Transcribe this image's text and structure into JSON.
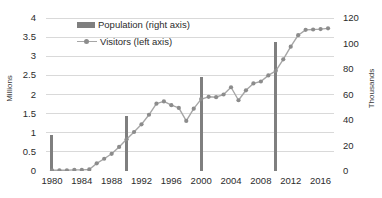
{
  "chart_data": {
    "type": "line",
    "title": "",
    "xlabel": "",
    "ylabel": "Millions",
    "ylabel_right": "Thousands",
    "grid": true,
    "legend_position": "top-left-inside",
    "x": [
      1980,
      1981,
      1982,
      1983,
      1984,
      1985,
      1986,
      1987,
      1988,
      1989,
      1990,
      1991,
      1992,
      1993,
      1994,
      1995,
      1996,
      1997,
      1998,
      1999,
      2000,
      2001,
      2002,
      2003,
      2004,
      2005,
      2006,
      2007,
      2008,
      2009,
      2010,
      2011,
      2012,
      2013,
      2014,
      2015,
      2016,
      2017
    ],
    "xticks": [
      1980,
      1984,
      1988,
      1992,
      1996,
      2000,
      2004,
      2008,
      2012,
      2016
    ],
    "xlim": [
      1979.2,
      2017.8
    ],
    "ylim_left": [
      0,
      4
    ],
    "yticks_left": [
      0,
      0.5,
      1,
      1.5,
      2,
      2.5,
      3,
      3.5,
      4
    ],
    "ylim_right": [
      0,
      120
    ],
    "yticks_right": [
      0,
      20,
      40,
      60,
      80,
      100,
      120
    ],
    "series": [
      {
        "name": "Visitors (left axis)",
        "axis": "left",
        "render": "line-markers",
        "color": "#a6a6a6",
        "marker_color": "#8c8c8c",
        "values": [
          0.02,
          0.02,
          0.02,
          0.03,
          0.03,
          0.04,
          0.2,
          0.32,
          0.45,
          0.63,
          0.83,
          1.02,
          1.22,
          1.47,
          1.76,
          1.82,
          1.72,
          1.65,
          1.31,
          1.63,
          1.88,
          1.94,
          1.93,
          2.0,
          2.19,
          1.85,
          2.11,
          2.29,
          2.34,
          2.5,
          2.62,
          2.92,
          3.25,
          3.55,
          3.69,
          3.7,
          3.71,
          3.73
        ]
      },
      {
        "name": "Population (right axis)",
        "axis": "right",
        "render": "bars",
        "color": "#7f7f7f",
        "bar_width_px": 3,
        "points": [
          {
            "x": 1980,
            "y": 28
          },
          {
            "x": 1990,
            "y": 43.5
          },
          {
            "x": 2000,
            "y": 73.5
          },
          {
            "x": 2010,
            "y": 101
          }
        ]
      }
    ],
    "legend": [
      {
        "label": "Population (right axis)",
        "marker": "bar-swatch"
      },
      {
        "label": "Visitors (left axis)",
        "marker": "line-marker-swatch"
      }
    ],
    "colors": {
      "bar": "#7f7f7f",
      "line": "#a6a6a6",
      "marker": "#8c8c8c",
      "grid": "#d9d9d9",
      "axis": "#868686",
      "text": "#2b2b2b",
      "background": "#ffffff"
    }
  }
}
